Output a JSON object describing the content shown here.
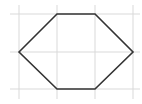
{
  "diagram": {
    "type": "hexagon-on-grid",
    "canvas": {
      "width": 142,
      "height": 104
    },
    "grid": {
      "color": "#d9d9d9",
      "vertical_lines_x": [
        19,
        57,
        95,
        133
      ],
      "horizontal_lines_y": [
        14,
        52,
        89
      ],
      "extent": {
        "x1": 10,
        "x2": 140,
        "y1": 5,
        "y2": 99
      }
    },
    "shape": {
      "name": "hexagon",
      "stroke": "#333333",
      "stroke_width": 1.6,
      "fill": "none",
      "vertices": [
        [
          19,
          52
        ],
        [
          57,
          14
        ],
        [
          95,
          14
        ],
        [
          133,
          52
        ],
        [
          95,
          89
        ],
        [
          57,
          89
        ]
      ]
    }
  }
}
